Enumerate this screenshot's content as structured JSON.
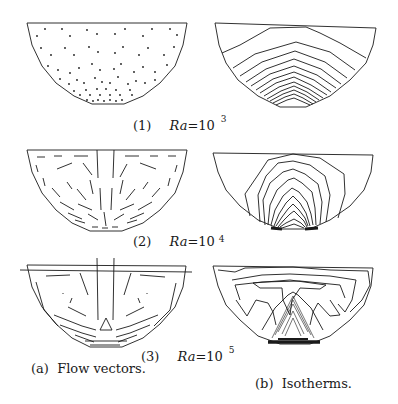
{
  "figure": {
    "rows": [
      {
        "index_label": "(1)",
        "ra_label": "Ra",
        "ra_eq": "=10",
        "ra_exponent": "3"
      },
      {
        "index_label": "(2)",
        "ra_label": "Ra",
        "ra_eq": "=10",
        "ra_exponent": "4"
      },
      {
        "index_label": "(3)",
        "ra_label": "Ra",
        "ra_eq": "=10",
        "ra_exponent": "5"
      }
    ],
    "columns": [
      {
        "caption": "(a)  Flow vectors."
      },
      {
        "caption": "(b)  Isotherms."
      }
    ],
    "colors": {
      "line": "#1a1a1a",
      "background": "#ffffff"
    }
  }
}
